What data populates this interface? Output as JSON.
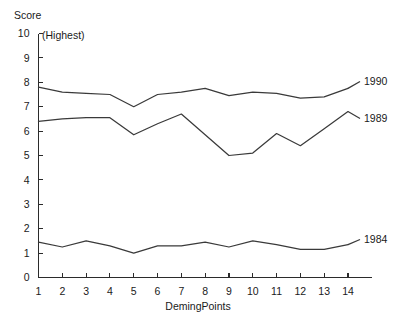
{
  "chart_data": {
    "type": "line",
    "title": "",
    "subtitle": "",
    "xlabel": "DemingPoints",
    "ylabel": "Score",
    "annotation": "(Highest)",
    "grid": false,
    "legend_position": "right-inline",
    "xlim": [
      1,
      14
    ],
    "ylim": [
      0,
      10
    ],
    "ytick_labels": [
      "0",
      "1",
      "2",
      "3",
      "4",
      "5",
      "6",
      "7",
      "8",
      "9",
      "10"
    ],
    "yticks": [
      0,
      1,
      2,
      3,
      4,
      5,
      6,
      7,
      8,
      9,
      10
    ],
    "xtick_labels": [
      "1",
      "2",
      "3",
      "4",
      "5",
      "6",
      "7",
      "8",
      "9",
      "10",
      "11",
      "12",
      "13",
      "14"
    ],
    "categories": [
      1,
      2,
      3,
      4,
      5,
      6,
      7,
      8,
      9,
      10,
      11,
      12,
      13,
      14
    ],
    "series": [
      {
        "name": "1990",
        "label": "1990",
        "color": "#3a3a3a",
        "values": [
          7.8,
          7.6,
          7.55,
          7.5,
          7.0,
          7.5,
          7.6,
          7.75,
          7.45,
          7.6,
          7.55,
          7.35,
          7.4,
          7.75
        ]
      },
      {
        "name": "1989",
        "label": "1989",
        "color": "#3a3a3a",
        "values": [
          6.4,
          6.5,
          6.55,
          6.55,
          5.85,
          6.3,
          6.7,
          5.85,
          5.0,
          5.1,
          5.9,
          5.4,
          6.1,
          6.8
        ]
      },
      {
        "name": "1984",
        "label": "1984",
        "color": "#3a3a3a",
        "values": [
          1.45,
          1.25,
          1.5,
          1.3,
          1.0,
          1.3,
          1.3,
          1.45,
          1.25,
          1.5,
          1.35,
          1.15,
          1.15,
          1.35
        ]
      }
    ]
  },
  "labels": {
    "y_axis_title": "Score",
    "x_axis_title": "DemingPoints",
    "highest_note": "(Highest)",
    "series_1990": "1990",
    "series_1989": "1989",
    "series_1984": "1984"
  }
}
